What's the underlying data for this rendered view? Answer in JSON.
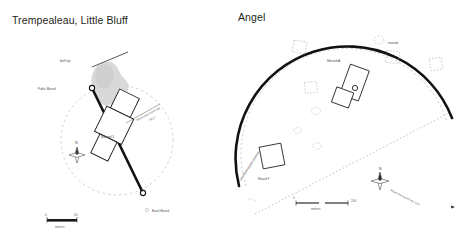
{
  "panels": [
    {
      "id": "trempealeau",
      "title": "Trempealeau, Little Bluff",
      "labels": {
        "bluff": "bluff top",
        "public_mound": "Public Mound",
        "mound_1": "Mound 1",
        "burial_mound": "Burial Mound",
        "alignment_line1": "Moon max north rise",
        "alignment_line2": "52.1°",
        "north": "N"
      },
      "scale": {
        "min": "0",
        "max": "50",
        "units": "meters"
      }
    },
    {
      "id": "angel",
      "title": "Angel",
      "labels": {
        "palisade": "Late Mississippian palisade",
        "mounds": "mounds",
        "mound_a": "Mound A",
        "mound_f": "Mound F",
        "alignment": "Moon min south rise 114°",
        "north": "N"
      },
      "scale": {
        "min": "0",
        "max": "200",
        "units": "meters"
      }
    }
  ],
  "colors": {
    "ink": "#231f20",
    "label": "#4d4d4d",
    "bluff_fill": "#d8d8d8",
    "dashed": "#9a9a9a",
    "heavy_line": "#111111"
  }
}
